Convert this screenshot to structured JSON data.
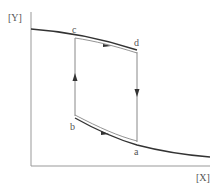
{
  "diagram": {
    "type": "hysteresis-loop",
    "axes": {
      "y_label": "[Y]",
      "x_label": "[X]"
    },
    "points": {
      "c": "c",
      "d": "d",
      "b": "b",
      "a": "a"
    },
    "colors": {
      "axis": "#999999",
      "curve": "#333333",
      "vertical": "#888888",
      "label": "#555555"
    },
    "transitions": [
      {
        "from": "b",
        "to": "c",
        "direction": "up"
      },
      {
        "from": "c",
        "to": "d",
        "direction": "right"
      },
      {
        "from": "d",
        "to": "a",
        "direction": "down"
      },
      {
        "from": "b",
        "to": "a",
        "direction": "right"
      }
    ]
  }
}
